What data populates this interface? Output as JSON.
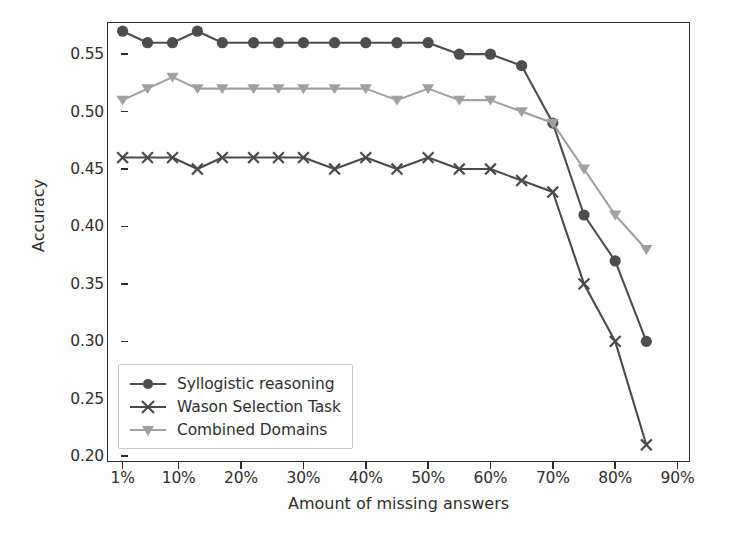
{
  "chart_data": {
    "type": "line",
    "title": "",
    "xlabel": "Amount of missing answers",
    "ylabel": "Accuracy",
    "grid": false,
    "legend_position": "lower left",
    "x": [
      1,
      5,
      9,
      13,
      17,
      22,
      26,
      30,
      35,
      40,
      45,
      50,
      55,
      60,
      65,
      70,
      75,
      80,
      85
    ],
    "x_tick_labels": [
      "1%",
      "10%",
      "20%",
      "30%",
      "40%",
      "50%",
      "60%",
      "70%",
      "80%",
      "90%"
    ],
    "x_tick_values": [
      1,
      10,
      20,
      30,
      40,
      50,
      60,
      70,
      80,
      90
    ],
    "xlim": [
      -1.5,
      92
    ],
    "y_tick_labels": [
      "0.20",
      "0.25",
      "0.30",
      "0.35",
      "0.40",
      "0.45",
      "0.50",
      "0.55"
    ],
    "y_tick_values": [
      0.2,
      0.25,
      0.3,
      0.35,
      0.4,
      0.45,
      0.5,
      0.55
    ],
    "ylim": [
      0.195,
      0.578
    ],
    "series": [
      {
        "name": "Syllogistic reasoning",
        "marker": "circle",
        "color": "#4d4d4d",
        "values": [
          0.57,
          0.56,
          0.56,
          0.57,
          0.56,
          0.56,
          0.56,
          0.56,
          0.56,
          0.56,
          0.56,
          0.56,
          0.55,
          0.55,
          0.54,
          0.49,
          0.41,
          0.37,
          0.3
        ]
      },
      {
        "name": "Wason Selection Task",
        "marker": "x",
        "color": "#4a4a4a",
        "values": [
          0.46,
          0.46,
          0.46,
          0.45,
          0.46,
          0.46,
          0.46,
          0.46,
          0.45,
          0.46,
          0.45,
          0.46,
          0.45,
          0.45,
          0.44,
          0.43,
          0.35,
          0.3,
          0.21
        ]
      },
      {
        "name": "Combined Domains",
        "marker": "triangle-down",
        "color": "#a0a0a0",
        "values": [
          0.51,
          0.52,
          0.53,
          0.52,
          0.52,
          0.52,
          0.52,
          0.52,
          0.52,
          0.52,
          0.51,
          0.52,
          0.51,
          0.51,
          0.5,
          0.49,
          0.45,
          0.41,
          0.38
        ]
      }
    ]
  },
  "axes": {
    "x_title": "Amount of missing answers",
    "y_title": "Accuracy"
  },
  "legend": {
    "items": [
      {
        "label": "Syllogistic reasoning"
      },
      {
        "label": "Wason Selection Task"
      },
      {
        "label": "Combined Domains"
      }
    ]
  }
}
